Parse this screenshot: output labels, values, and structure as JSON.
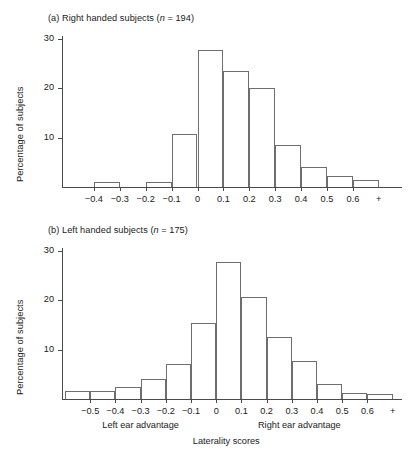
{
  "figure": {
    "axis_color": "#4a4a4a",
    "bar_outline_color": "#6e6e6e",
    "background": "#ffffff"
  },
  "panel_a": {
    "title_prefix": "(a) Right handed subjects (",
    "title_n_symbol": "n",
    "title_suffix": " = 194)",
    "ylabel": "Percentage of subjects"
  },
  "panel_b": {
    "title_prefix": "(b) Left handed subjects (",
    "title_n_symbol": "n",
    "title_suffix": " = 175)",
    "ylabel": "Percentage of subjects",
    "left_caption": "Left ear advantage",
    "right_caption": "Right ear advantage",
    "xlabel": "Laterality scores"
  },
  "chart_data": [
    {
      "type": "bar",
      "id": "panel-a",
      "title": "(a) Right handed subjects (n = 194)",
      "n": 194,
      "xlabel": "",
      "ylabel": "Percentage of subjects",
      "ylim": [
        0,
        30
      ],
      "yticks": [
        10,
        20,
        30
      ],
      "ytick_labels": [
        "10",
        "20",
        "30"
      ],
      "grid": false,
      "legend": "none",
      "xtick_labels": [
        "−0.4",
        "−0.3",
        "−0.2",
        "−0.1",
        "0",
        "0.1",
        "0.2",
        "0.3",
        "0.4",
        "0.5",
        "0.6",
        "+"
      ],
      "bin_edges": [
        "−0.5",
        "−0.4",
        "−0.3",
        "−0.2",
        "−0.1",
        "0",
        "0.1",
        "0.2",
        "0.3",
        "0.4",
        "0.5",
        "0.6",
        "+"
      ],
      "categories": [
        "−0.5 to −0.4",
        "−0.4 to −0.3",
        "−0.3 to −0.2",
        "−0.2 to −0.1",
        "−0.1 to 0",
        "0 to 0.1",
        "0.1 to 0.2",
        "0.2 to 0.3",
        "0.3 to 0.4",
        "0.4 to 0.5",
        "0.5 to 0.6",
        "0.6 +"
      ],
      "values": [
        0,
        1.0,
        0,
        1.0,
        10.8,
        27.7,
        23.5,
        20.0,
        8.5,
        4.0,
        2.3,
        1.5
      ]
    },
    {
      "type": "bar",
      "id": "panel-b",
      "title": "(b) Left handed subjects (n = 175)",
      "n": 175,
      "xlabel": "Laterality scores",
      "ylabel": "Percentage of subjects",
      "ylim": [
        0,
        30
      ],
      "yticks": [
        10,
        20,
        30
      ],
      "ytick_labels": [
        "10",
        "20",
        "30"
      ],
      "grid": false,
      "legend": "none",
      "xtick_labels": [
        "−0.5",
        "−0.4",
        "−0.3",
        "−0.2",
        "−0.1",
        "0",
        "0.1",
        "0.2",
        "0.3",
        "0.4",
        "0.5",
        "0.6",
        "+"
      ],
      "bin_edges": [
        "−0.6",
        "−0.5",
        "−0.4",
        "−0.3",
        "−0.2",
        "−0.1",
        "0",
        "0.1",
        "0.2",
        "0.3",
        "0.4",
        "0.5",
        "0.6",
        "+"
      ],
      "categories": [
        "−0.6 to −0.5",
        "−0.5 to −0.4",
        "−0.4 to −0.3",
        "−0.3 to −0.2",
        "−0.2 to −0.1",
        "−0.1 to 0",
        "0 to 0.1",
        "0.1 to 0.2",
        "0.2 to 0.3",
        "0.3 to 0.4",
        "0.4 to 0.5",
        "0.5 to 0.6",
        "0.6 +"
      ],
      "values": [
        1.7,
        1.7,
        2.5,
        4.0,
        7.0,
        15.4,
        27.8,
        20.6,
        12.5,
        7.7,
        3.0,
        1.3,
        1.0
      ],
      "annotations": [
        "Left ear advantage",
        "Right ear advantage"
      ]
    }
  ]
}
